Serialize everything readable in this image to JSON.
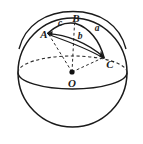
{
  "figure": {
    "kind": "geometry-diagram",
    "width": 143,
    "height": 144,
    "background_color": "#ffffff",
    "stroke_color": "#1a1a1a",
    "dash_color": "#2b2b2b"
  },
  "labels": {
    "vertex_a": "A",
    "vertex_b": "B",
    "vertex_c": "C",
    "center_o": "O",
    "side_a": "a",
    "side_b": "b",
    "side_c": "c"
  },
  "label_positions": {
    "vertex_a": {
      "x": 44,
      "y": 34
    },
    "vertex_b": {
      "x": 76,
      "y": 18
    },
    "vertex_c": {
      "x": 110,
      "y": 63
    },
    "center_o": {
      "x": 72,
      "y": 82
    },
    "side_a": {
      "x": 97,
      "y": 29
    },
    "side_b": {
      "x": 79,
      "y": 37
    },
    "side_c": {
      "x": 60,
      "y": 24
    }
  },
  "points": {
    "sphere_center": {
      "x": 72.5,
      "y": 72.5,
      "radius": 54.5
    },
    "A": {
      "x": 48,
      "y": 33
    },
    "B": {
      "x": 75,
      "y": 23
    },
    "C": {
      "x": 104,
      "y": 57
    },
    "O": {
      "x": 72,
      "y": 72
    }
  },
  "geometry": {
    "equator": {
      "cx": 72.5,
      "cy": 72.5,
      "rx": 54.5,
      "ry": 16.5
    },
    "great_circle_arc": "M 19,48 C 26,24 47,12 73,12 C 99,12 120,25 126,48",
    "arc_c_path": "M 48,33 C 56,25 66,21 75,23",
    "arc_a_path": "M 75,23 C 90,28 100,41 104,57",
    "arc_b_path": "M 48,33 C 66,34 88,43 104,57",
    "arc_b_lower_path": "M 48,34 C 68,40 90,49 104,58"
  }
}
